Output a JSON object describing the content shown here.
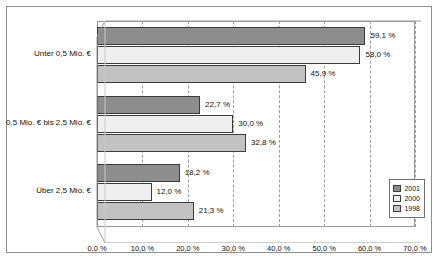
{
  "chart_data": {
    "type": "bar",
    "orientation": "horizontal",
    "title": "",
    "xlabel": "",
    "ylabel": "",
    "xlim": [
      0,
      70
    ],
    "grid": true,
    "legend_position": "bottom-right",
    "categories": [
      "Unter 0,5 Mio. €",
      "0,5 Mio. € bis 2,5 Mio. €",
      "Über 2,5 Mio. €"
    ],
    "series": [
      {
        "name": "2001",
        "color": "#8d8d8d",
        "values": [
          59.1,
          22.7,
          18.2
        ],
        "labels": [
          "59,1 %",
          "22,7 %",
          "18,2 %"
        ]
      },
      {
        "name": "2000",
        "color": "#efefef",
        "values": [
          58.0,
          30.0,
          12.0
        ],
        "labels": [
          "58,0 %",
          "30,0 %",
          "12,0 %"
        ]
      },
      {
        "name": "1998",
        "color": "#c2c2c2",
        "values": [
          45.9,
          32.8,
          21.3
        ],
        "labels": [
          "45,9 %",
          "32,8 %",
          "21,3 %"
        ]
      }
    ],
    "xticks": [
      0,
      10,
      20,
      30,
      40,
      50,
      60,
      70
    ],
    "xticklabels": [
      "0,0 %",
      "10,0 %",
      "20,0 %",
      "30,0 %",
      "40,0 %",
      "50,0 %",
      "60,0 %",
      "70,0 %"
    ]
  },
  "legend": {
    "items": [
      {
        "label": "2001"
      },
      {
        "label": "2000"
      },
      {
        "label": "1998"
      }
    ]
  }
}
